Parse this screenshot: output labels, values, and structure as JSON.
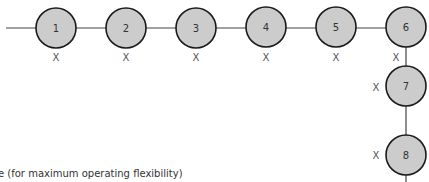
{
  "diagram": {
    "node_fill": "#cccccc",
    "node_stroke": "#1a1a1a",
    "line_color": "#444444",
    "nodes": [
      {
        "label": "1",
        "cx": 56,
        "cy": 28,
        "mark": "X",
        "mx": 56,
        "my": 57
      },
      {
        "label": "2",
        "cx": 126,
        "cy": 28,
        "mark": "X",
        "mx": 126,
        "my": 57
      },
      {
        "label": "3",
        "cx": 196,
        "cy": 28,
        "mark": "X",
        "mx": 196,
        "my": 57
      },
      {
        "label": "4",
        "cx": 266,
        "cy": 27,
        "mark": "X",
        "mx": 266,
        "my": 57
      },
      {
        "label": "5",
        "cx": 336,
        "cy": 27,
        "mark": "X",
        "mx": 336,
        "my": 57
      },
      {
        "label": "6",
        "cx": 406,
        "cy": 27,
        "mark": "X",
        "mx": 396,
        "my": 57
      },
      {
        "label": "7",
        "cx": 406,
        "cy": 86,
        "mark": "X",
        "mx": 376,
        "my": 87
      },
      {
        "label": "8",
        "cx": 406,
        "cy": 155,
        "mark": "X",
        "mx": 376,
        "my": 155
      }
    ],
    "caption": "e (for maximum operating flexibility)"
  }
}
